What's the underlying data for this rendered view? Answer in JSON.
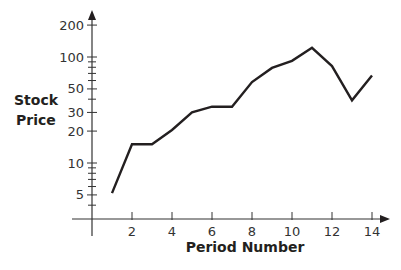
{
  "chart_data": {
    "type": "line",
    "title": "",
    "xlabel": "Period Number",
    "ylabel": "Stock Price",
    "yscale": "log",
    "x": [
      1,
      2,
      3,
      4,
      5,
      6,
      7,
      8,
      9,
      10,
      11,
      12,
      13,
      14
    ],
    "series": [
      {
        "name": "Stock Price",
        "values": [
          5.2,
          15,
          15,
          20.5,
          30,
          34,
          34,
          58,
          79,
          92,
          122,
          82,
          39,
          67
        ]
      }
    ],
    "x_ticks": [
      2,
      4,
      6,
      8,
      10,
      12,
      14
    ],
    "x_tick_labels": [
      "2",
      "4",
      "6",
      "8",
      "10",
      "12",
      "14"
    ],
    "y_ticks": [
      5,
      10,
      20,
      30,
      50,
      100,
      200
    ],
    "y_tick_labels": [
      "5",
      "10",
      "20",
      "30",
      "50",
      "100",
      "200"
    ],
    "y_minor_ticks": [
      4,
      6,
      7,
      8,
      9,
      40,
      60,
      70,
      80,
      90
    ],
    "xlim": [
      0,
      14.5
    ],
    "grid": false,
    "legend": "none",
    "line_color": "#231f20"
  },
  "labels": {
    "ylabel_line1": "Stock",
    "ylabel_line2": "Price",
    "xlabel": "Period Number"
  }
}
